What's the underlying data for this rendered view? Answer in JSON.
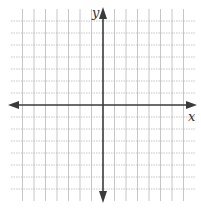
{
  "diagram": {
    "type": "coordinate-plane",
    "x_axis_label": "x",
    "y_axis_label": "y",
    "grid": {
      "cells_left_of_y_axis": 8,
      "cells_right_of_y_axis": 8,
      "cells_above_x_axis": 8,
      "cells_below_x_axis": 8,
      "grid_line_color": "#b8b8b8",
      "axis_color": "#3a3a3a"
    },
    "arrows": [
      "left",
      "right",
      "up",
      "down"
    ]
  }
}
